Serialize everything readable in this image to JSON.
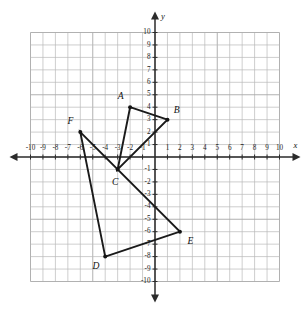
{
  "figure": {
    "background_color": "#ffffff",
    "grid_color": "#b9b9b9",
    "axis_color": "#2b2b2b",
    "shape_color": "#1a1a1a"
  },
  "axes": {
    "x_label": "x",
    "y_label": "y",
    "x_min": -10,
    "x_max": 10,
    "y_min": -10,
    "y_max": 10,
    "step": 1,
    "grid": true,
    "x_tick_labels": [
      "-10",
      "-9",
      "-8",
      "-7",
      "-6",
      "-5",
      "-4",
      "-3",
      "-2",
      "-1",
      "1",
      "2",
      "3",
      "4",
      "5",
      "6",
      "7",
      "8",
      "9",
      "10"
    ],
    "y_tick_labels": [
      "10",
      "9",
      "8",
      "7",
      "6",
      "5",
      "4",
      "3",
      "2",
      "1",
      "-1",
      "-2",
      "-3",
      "-4",
      "-5",
      "-6",
      "-7",
      "-8",
      "-9",
      "-10"
    ]
  },
  "chart_data": {
    "type": "scatter",
    "xlabel": "x",
    "ylabel": "y",
    "xlim": [
      -10,
      10
    ],
    "ylim": [
      -10,
      10
    ],
    "grid": true,
    "legend": "none",
    "shapes": [
      {
        "name": "triangle-abc",
        "closed": true,
        "vertices": [
          {
            "label": "A",
            "x": -2,
            "y": 4,
            "label_dx": -0.75,
            "label_dy": 0.85
          },
          {
            "label": "B",
            "x": 1,
            "y": 3,
            "label_dx": 0.75,
            "label_dy": 0.75
          },
          {
            "label": "C",
            "x": -3,
            "y": -1,
            "label_dx": -0.2,
            "label_dy": -1.05
          }
        ]
      },
      {
        "name": "triangle-def",
        "closed": true,
        "vertices": [
          {
            "label": "D",
            "x": -4,
            "y": -8,
            "label_dx": -0.75,
            "label_dy": -0.85
          },
          {
            "label": "E",
            "x": 2,
            "y": -6,
            "label_dx": 0.85,
            "label_dy": -0.85
          },
          {
            "label": "F",
            "x": -6,
            "y": 2,
            "label_dx": -0.8,
            "label_dy": 0.85
          }
        ]
      }
    ],
    "points": [
      {
        "label": "A",
        "x": -2,
        "y": 4
      },
      {
        "label": "B",
        "x": 1,
        "y": 3
      },
      {
        "label": "C",
        "x": -3,
        "y": -1
      },
      {
        "label": "D",
        "x": -4,
        "y": -8
      },
      {
        "label": "E",
        "x": 2,
        "y": -6
      },
      {
        "label": "F",
        "x": -6,
        "y": 2
      }
    ]
  }
}
